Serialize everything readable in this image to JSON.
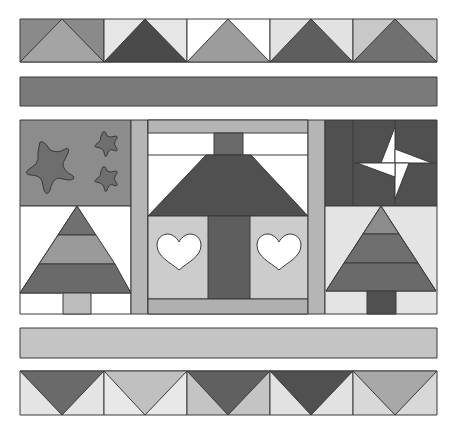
{
  "diagram": {
    "title": "",
    "type": "quilt-pattern",
    "palette": {
      "white": "#ffffff",
      "light": "#d2d2d2",
      "lighter": "#e4e4e4",
      "mid": "#a4a4a4",
      "midDark": "#8a8a8a",
      "dark": "#5e5e5e",
      "darker": "#4a4a4a",
      "outline": "#3a3a3a"
    },
    "rows": [
      {
        "name": "top-flying-geese-border",
        "blocks": 5,
        "direction": "up"
      },
      {
        "name": "dark-strip-border"
      },
      {
        "name": "center-panel",
        "blocks": [
          "star-block",
          "tree-block",
          "house-block",
          "pinwheel-block",
          "tree-block"
        ]
      },
      {
        "name": "light-strip-border"
      },
      {
        "name": "bottom-flying-geese-border",
        "blocks": 5,
        "direction": "down"
      }
    ]
  }
}
